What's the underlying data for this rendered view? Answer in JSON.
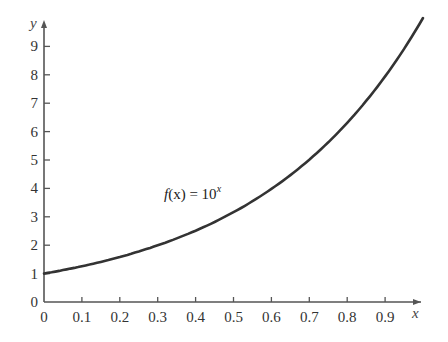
{
  "chart_data": {
    "type": "line",
    "title": "",
    "xlabel": "x",
    "ylabel": "y",
    "xlim": [
      0,
      1
    ],
    "ylim": [
      0,
      10
    ],
    "grid": false,
    "legend": null,
    "x_ticks": [
      "0",
      "0.1",
      "0.2",
      "0.3",
      "0.4",
      "0.5",
      "0.6",
      "0.7",
      "0.8",
      "0.9"
    ],
    "y_ticks": [
      "0",
      "1",
      "2",
      "3",
      "4",
      "5",
      "6",
      "7",
      "8",
      "9"
    ],
    "annotations": [
      {
        "text_fn": "f",
        "text_arg": "(x) = 10",
        "text_exp": "x",
        "full_text": "f(x) = 10^x"
      }
    ],
    "series": [
      {
        "name": "f(x) = 10^x",
        "x": [
          0,
          0.1,
          0.2,
          0.3,
          0.4,
          0.5,
          0.6,
          0.7,
          0.8,
          0.9,
          1.0
        ],
        "y": [
          1,
          1.26,
          1.58,
          2.0,
          2.51,
          3.16,
          3.98,
          5.01,
          6.31,
          7.94,
          10.0
        ]
      }
    ],
    "colors": {
      "axis": "#555555",
      "curve": "#333333",
      "text": "#333333"
    }
  }
}
